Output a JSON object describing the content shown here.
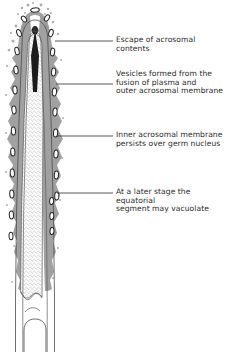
{
  "figure": {
    "type": "biological-diagram",
    "background_color": "#ffffff",
    "ink_color": "#2b2b2b",
    "cytoplasm_gray": "#9a9a9a",
    "stipple_color": "#6e6e6e",
    "leader_line_color": "#3a3a3a"
  },
  "labels": [
    {
      "id": "escape-of-acrosomal-contents",
      "lines": [
        "Escape of acrosomal",
        "contents"
      ],
      "text_x": 116,
      "text_y": 36,
      "leader": {
        "x1": 55,
        "y1": 41,
        "x2": 113,
        "y2": 41
      }
    },
    {
      "id": "vesicles-formed-from-fusion",
      "lines": [
        "Vesicles formed from the",
        "fusion of plasma and",
        "outer acrosomal membrane"
      ],
      "text_x": 116,
      "text_y": 70,
      "leader": {
        "x1": 56,
        "y1": 84,
        "x2": 113,
        "y2": 84
      }
    },
    {
      "id": "inner-acrosomal-membrane",
      "lines": [
        "Inner acrosomal membrane",
        "persists over germ nucleus"
      ],
      "text_x": 116,
      "text_y": 131,
      "leader": {
        "x1": 57,
        "y1": 136,
        "x2": 113,
        "y2": 136
      }
    },
    {
      "id": "equatorial-segment-vacuolate",
      "lines": [
        "At a later stage the",
        "equatorial",
        "segment may vacuolate"
      ],
      "text_x": 116,
      "text_y": 188,
      "leader": {
        "x1": 57,
        "y1": 193,
        "x2": 113,
        "y2": 193
      }
    }
  ],
  "diagram_parts": [
    {
      "id": "sperm-head-outline",
      "description": "elongated tapering head outline"
    },
    {
      "id": "acrosomal-cap-gray",
      "description": "gray mottled outer acrosomal / plasma membrane layer"
    },
    {
      "id": "stippled-nucleus",
      "description": "stippled germ nucleus core"
    },
    {
      "id": "apical-dark-wedge",
      "description": "dark triangular wedge at apex"
    },
    {
      "id": "vesicle-chain-left",
      "description": "column of membrane vesicles along left margin"
    },
    {
      "id": "vesicle-chain-right",
      "description": "column of membrane vesicles along right margin"
    },
    {
      "id": "equatorial-vacuole",
      "description": "scalloped vacuolated equatorial segment at base"
    },
    {
      "id": "tail-arch",
      "description": "arched base outline below nucleus"
    }
  ]
}
